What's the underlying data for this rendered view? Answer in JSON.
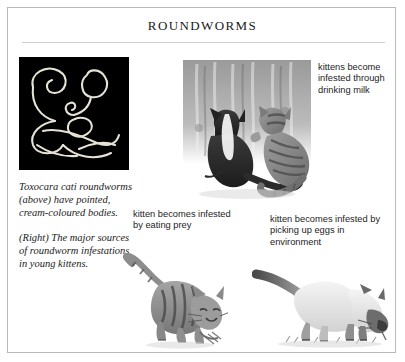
{
  "page": {
    "title": "ROUNDWORMS",
    "background_color": "#ffffff",
    "border_color": "#b9b9b9",
    "rule_color": "#cfcfcf",
    "text_color": "#1b1b1b"
  },
  "worm_photo": {
    "name": "toxocara-cati-roundworms-photo",
    "background_color": "#000000",
    "worm_color": "#e8e4d8"
  },
  "caption_left": {
    "paragraph_1": "Toxocara cati roundworms (above) have pointed, cream-coloured bodies.",
    "paragraph_2": "(Right) The major sources of roundworm infestations in young kittens."
  },
  "labels": {
    "milk": "kittens become infested through drinking milk",
    "prey": "kitten becomes infested by eating prey",
    "eggs": "kitten becomes infested by picking up eggs in environment"
  },
  "illustrations": {
    "nursing": "two-kittens-nursing-illustration",
    "eating": "tabby-cat-eating-prey-illustration",
    "sniffing": "siamese-cat-sniffing-ground-illustration"
  }
}
